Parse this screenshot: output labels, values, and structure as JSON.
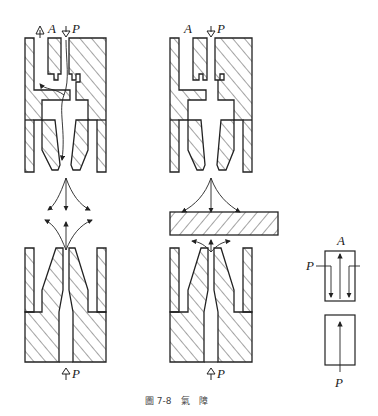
{
  "header": {
    "text": ""
  },
  "figure": {
    "caption": "圖 7-8　氣　障",
    "number": "圖 7-8",
    "title": "氣　障"
  },
  "diagram_left": {
    "top_labels": {
      "a": "A",
      "p": "P"
    },
    "bottom_label": "P",
    "description": "Air barrier valve — free flow: supply P jets out, part of flow returns through port A"
  },
  "diagram_middle": {
    "top_labels": {
      "a": "A",
      "p": "P"
    },
    "bottom_label": "P",
    "description": "Air barrier valve — blocked: object interrupts jet, pressure builds at port A"
  },
  "symbol": {
    "labels": {
      "a": "A",
      "p_side": "P",
      "p_bottom": "P"
    },
    "description": "Pneumatic symbol for air barrier (two-position block)"
  },
  "colors": {
    "ink": "#222222",
    "paper": "#ffffff",
    "hatch": "#333333"
  }
}
